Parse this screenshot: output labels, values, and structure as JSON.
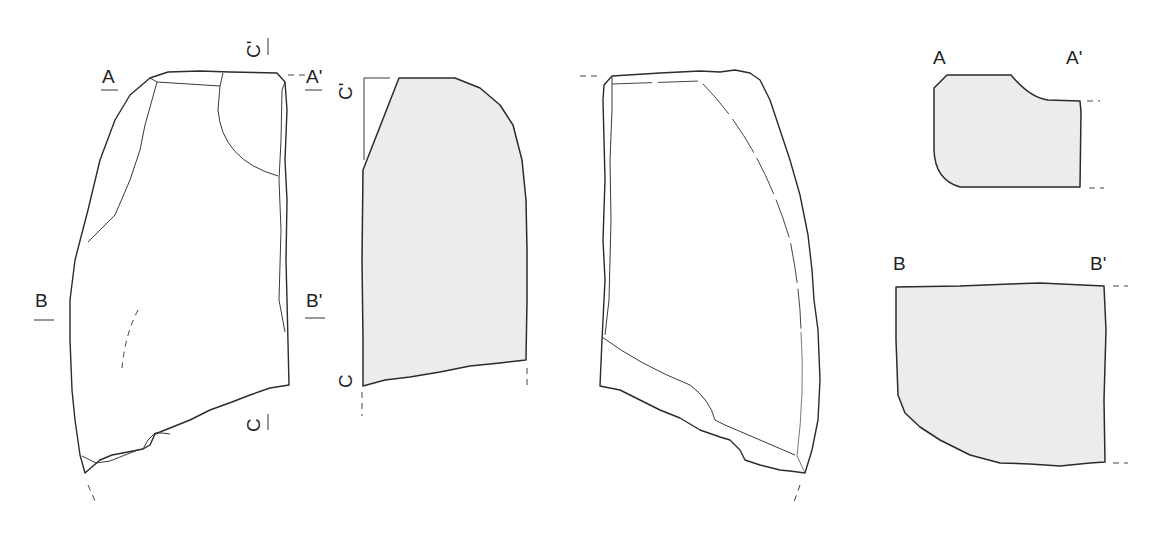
{
  "figure": {
    "type": "lithic artifact technical drawing",
    "fill_color": "#ececec",
    "line_color": "#2b2b2b",
    "views": [
      {
        "name": "dorsal-view",
        "labels": {
          "left_top": "A",
          "right_top": "A'",
          "left_mid": "B",
          "right_mid": "B'",
          "top_section": "C'",
          "bottom_section": "C"
        }
      },
      {
        "name": "profile-section-c",
        "labels": {
          "top": "C'",
          "bottom": "C"
        }
      },
      {
        "name": "ventral-view"
      },
      {
        "name": "section-a",
        "labels": {
          "left": "A",
          "right": "A'"
        }
      },
      {
        "name": "section-b",
        "labels": {
          "left": "B",
          "right": "B'"
        }
      }
    ]
  },
  "labels": {
    "a": "A",
    "a_prime": "A'",
    "b": "B",
    "b_prime": "B'",
    "c": "C",
    "c_prime": "C'",
    "sec_a_left": "A",
    "sec_a_right": "A'",
    "sec_b_left": "B",
    "sec_b_right": "B'"
  }
}
